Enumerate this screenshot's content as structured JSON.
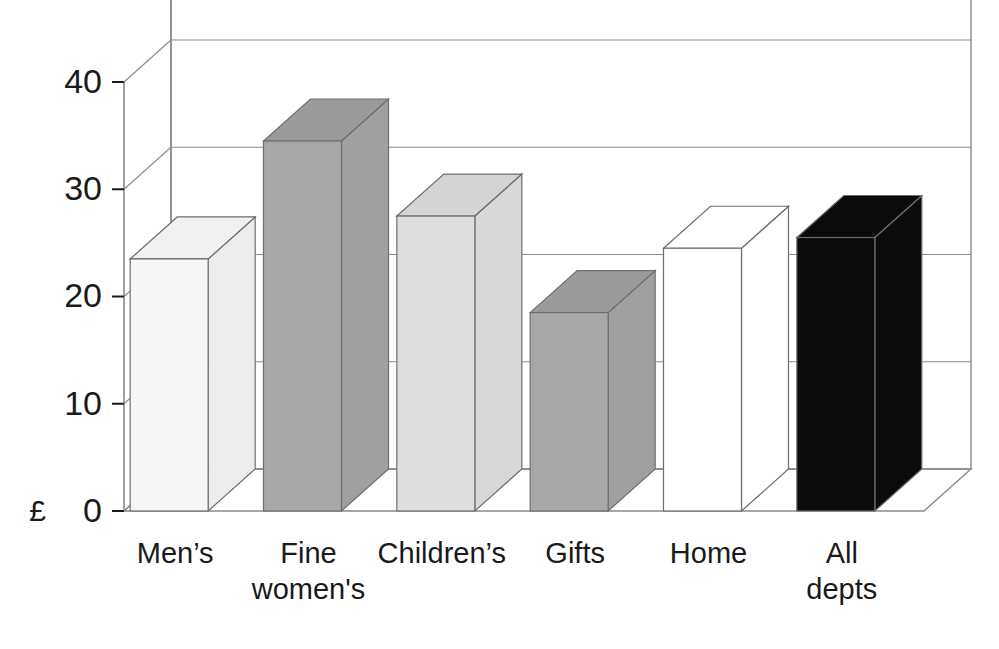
{
  "chart_data": {
    "type": "bar",
    "title": "",
    "subtitle": "",
    "xlabel": "",
    "ylabel": "£",
    "categories": [
      "Men's",
      "Fine women's",
      "Children's",
      "Gifts",
      "Home",
      "All depts"
    ],
    "category_lines": [
      [
        "Men’s"
      ],
      [
        "Fine",
        "women's"
      ],
      [
        "Children’s"
      ],
      [
        "Gifts"
      ],
      [
        "Home"
      ],
      [
        "All",
        "depts"
      ]
    ],
    "values": [
      23.5,
      34.5,
      27.5,
      18.5,
      24.5,
      25.5
    ],
    "ylim": [
      0,
      44
    ],
    "yticks": [
      0,
      10,
      20,
      30,
      40
    ],
    "ytick_labels": [
      "0",
      "10",
      "20",
      "30",
      "40"
    ],
    "grid": true,
    "gridlines_at": [
      10,
      20,
      30,
      40
    ],
    "legend": "none",
    "style": "3d-bars",
    "bar_colors": [
      "#f7f7f7",
      "#a8a8a8",
      "#dedede",
      "#a8a8a8",
      "#ffffff",
      "#0b0b0b"
    ],
    "bar_top_colors": [
      "#f1f1f1",
      "#9b9b9b",
      "#d4d4d4",
      "#9b9b9b",
      "#ffffff",
      "#0b0b0b"
    ],
    "bar_side_colors": [
      "#ececec",
      "#a0a0a0",
      "#d8d8d8",
      "#a0a0a0",
      "#ffffff",
      "#0b0b0b"
    ],
    "axis_color": "#8a8a8a",
    "outline_color": "#6e6e6e",
    "text_color": "#1a1a1a",
    "background": "#ffffff"
  },
  "axis": {
    "currency_symbol": "£",
    "ticks": [
      {
        "label": "40",
        "value": 40
      },
      {
        "label": "30",
        "value": 30
      },
      {
        "label": "20",
        "value": 20
      },
      {
        "label": "10",
        "value": 10
      },
      {
        "label": "0",
        "value": 0
      }
    ]
  },
  "bars": [
    {
      "label_lines": [
        "Men’s"
      ],
      "value": 23.5,
      "fill": "#f7f7f7",
      "top": "#f1f1f1",
      "side": "#ececec",
      "name": "bar-mens"
    },
    {
      "label_lines": [
        "Fine",
        "women's"
      ],
      "value": 34.5,
      "fill": "#a8a8a8",
      "top": "#9b9b9b",
      "side": "#a0a0a0",
      "name": "bar-fine-womens"
    },
    {
      "label_lines": [
        "Children’s"
      ],
      "value": 27.5,
      "fill": "#dedede",
      "top": "#d4d4d4",
      "side": "#d8d8d8",
      "name": "bar-childrens"
    },
    {
      "label_lines": [
        "Gifts"
      ],
      "value": 18.5,
      "fill": "#a8a8a8",
      "top": "#9b9b9b",
      "side": "#a0a0a0",
      "name": "bar-gifts"
    },
    {
      "label_lines": [
        "Home"
      ],
      "value": 24.5,
      "fill": "#ffffff",
      "top": "#ffffff",
      "side": "#ffffff",
      "name": "bar-home"
    },
    {
      "label_lines": [
        "All",
        "depts"
      ],
      "value": 25.5,
      "fill": "#0b0b0b",
      "top": "#0b0b0b",
      "side": "#0b0b0b",
      "name": "bar-all-depts"
    }
  ]
}
